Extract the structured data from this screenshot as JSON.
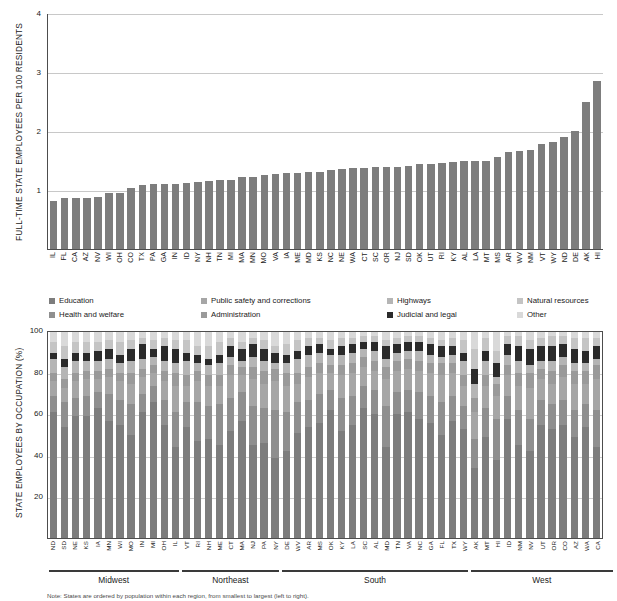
{
  "note": "Note: States are ordered by population within each region, from smallest to largest (left to right).",
  "legend": {
    "items": [
      {
        "label": "Education",
        "color": "#7d7d7d"
      },
      {
        "label": "Health and welfare",
        "color": "#8f8f8f"
      },
      {
        "label": "Public safety and corrections",
        "color": "#a6a6a6"
      },
      {
        "label": "Administration",
        "color": "#9a9a9a"
      },
      {
        "label": "Highways",
        "color": "#b5b5b5"
      },
      {
        "label": "Judicial and legal",
        "color": "#2b2b2b"
      },
      {
        "label": "Natural resources",
        "color": "#c4c4c4"
      },
      {
        "label": "Other",
        "color": "#d9d9d9"
      }
    ]
  },
  "regions": [
    {
      "name": "Midwest",
      "count": 12
    },
    {
      "name": "Northeast",
      "count": 9
    },
    {
      "name": "South",
      "count": 17
    },
    {
      "name": "West",
      "count": 13
    }
  ],
  "chart_data": [
    {
      "type": "bar",
      "id": "employees-per-100-residents",
      "title": "",
      "xlabel": "",
      "ylabel": "FULL-TIME STATE EMPLOYEES PER 100 RESIDENTS",
      "ylim": [
        0,
        4
      ],
      "yticks": [
        1,
        2,
        3,
        4
      ],
      "grid": true,
      "bar_color": "#7d7d7d",
      "categories": [
        "IL",
        "FL",
        "CA",
        "AZ",
        "NV",
        "WI",
        "OH",
        "CO",
        "TX",
        "PA",
        "GA",
        "IN",
        "ID",
        "NY",
        "NH",
        "TN",
        "MI",
        "MA",
        "MN",
        "MO",
        "VA",
        "IA",
        "ME",
        "MD",
        "KS",
        "NC",
        "NE",
        "WA",
        "CT",
        "SC",
        "OR",
        "NJ",
        "SD",
        "OK",
        "UT",
        "RI",
        "KY",
        "AL",
        "LA",
        "MT",
        "MS",
        "AR",
        "WV",
        "NM",
        "VT",
        "WY",
        "ND",
        "DE",
        "AK",
        "HI"
      ],
      "values": [
        0.82,
        0.86,
        0.87,
        0.87,
        0.88,
        0.95,
        0.96,
        1.04,
        1.09,
        1.1,
        1.1,
        1.11,
        1.13,
        1.14,
        1.16,
        1.18,
        1.18,
        1.22,
        1.22,
        1.26,
        1.28,
        1.3,
        1.3,
        1.31,
        1.31,
        1.35,
        1.37,
        1.38,
        1.38,
        1.39,
        1.39,
        1.4,
        1.41,
        1.44,
        1.44,
        1.46,
        1.48,
        1.49,
        1.49,
        1.49,
        1.56,
        1.65,
        1.66,
        1.69,
        1.78,
        1.83,
        1.9,
        2.01,
        2.51,
        2.86
      ]
    },
    {
      "type": "bar",
      "id": "employees-by-occupation",
      "stacked": true,
      "title": "",
      "xlabel": "",
      "ylabel": "STATE EMPLOYEES BY OCCUPATION (%)",
      "ylim": [
        0,
        100
      ],
      "yticks": [
        20,
        40,
        60,
        80,
        100
      ],
      "grid": true,
      "categories": [
        "ND",
        "SD",
        "NE",
        "KS",
        "IA",
        "MN",
        "WI",
        "MO",
        "IN",
        "MI",
        "OH",
        "IL",
        "VT",
        "RI",
        "NH",
        "ME",
        "CT",
        "MA",
        "NJ",
        "PA",
        "NY",
        "DE",
        "WV",
        "AR",
        "MS",
        "OK",
        "KY",
        "LA",
        "SC",
        "AL",
        "MD",
        "TN",
        "VA",
        "NC",
        "GA",
        "FL",
        "TX",
        "WY",
        "AK",
        "MT",
        "HI",
        "ID",
        "NM",
        "NV",
        "UT",
        "OR",
        "CO",
        "AZ",
        "WA",
        "CA"
      ],
      "series": [
        {
          "name": "Education",
          "color": "#7d7d7d",
          "values": [
            61,
            54,
            59,
            59,
            63,
            57,
            55,
            50,
            61,
            66,
            55,
            44,
            54,
            47,
            48,
            45,
            52,
            57,
            45,
            46,
            39,
            42,
            51,
            54,
            56,
            62,
            52,
            55,
            63,
            60,
            44,
            60,
            61,
            58,
            56,
            50,
            57,
            53,
            34,
            49,
            38,
            58,
            45,
            42,
            55,
            53,
            55,
            49,
            54,
            44
          ]
        },
        {
          "name": "Health and welfare",
          "color": "#8f8f8f",
          "values": [
            8,
            12,
            9,
            10,
            8,
            13,
            12,
            15,
            9,
            8,
            12,
            17,
            12,
            19,
            16,
            20,
            16,
            14,
            19,
            17,
            23,
            19,
            15,
            13,
            14,
            10,
            16,
            14,
            11,
            12,
            20,
            11,
            11,
            13,
            13,
            16,
            12,
            11,
            14,
            14,
            20,
            11,
            17,
            16,
            12,
            12,
            12,
            13,
            11,
            18
          ]
        },
        {
          "name": "Public safety and corrections",
          "color": "#a6a6a6",
          "values": [
            7,
            7,
            8,
            8,
            6,
            8,
            9,
            10,
            8,
            6,
            9,
            13,
            8,
            10,
            10,
            9,
            11,
            8,
            13,
            12,
            14,
            13,
            9,
            11,
            10,
            8,
            11,
            11,
            9,
            9,
            13,
            10,
            10,
            10,
            11,
            13,
            11,
            10,
            13,
            11,
            11,
            10,
            12,
            15,
            10,
            10,
            11,
            13,
            10,
            15
          ]
        },
        {
          "name": "Administration",
          "color": "#9a9a9a",
          "values": [
            4,
            4,
            4,
            4,
            4,
            4,
            4,
            5,
            4,
            4,
            5,
            6,
            5,
            5,
            5,
            5,
            5,
            4,
            6,
            6,
            6,
            6,
            5,
            5,
            5,
            4,
            5,
            5,
            5,
            5,
            6,
            5,
            5,
            5,
            5,
            6,
            5,
            5,
            7,
            5,
            6,
            5,
            6,
            7,
            5,
            6,
            6,
            6,
            6,
            7
          ]
        },
        {
          "name": "Highways",
          "color": "#b5b5b5",
          "values": [
            7,
            6,
            6,
            5,
            5,
            5,
            5,
            6,
            5,
            4,
            5,
            5,
            7,
            4,
            5,
            6,
            4,
            3,
            5,
            5,
            3,
            5,
            7,
            6,
            5,
            5,
            5,
            5,
            4,
            5,
            4,
            4,
            4,
            5,
            4,
            3,
            4,
            7,
            7,
            7,
            3,
            5,
            6,
            4,
            4,
            5,
            4,
            4,
            4,
            3
          ]
        },
        {
          "name": "Judicial and legal",
          "color": "#2b2b2b",
          "values": [
            3,
            4,
            4,
            4,
            5,
            5,
            4,
            6,
            7,
            4,
            7,
            7,
            4,
            4,
            3,
            4,
            5,
            6,
            6,
            6,
            5,
            4,
            4,
            4,
            4,
            3,
            4,
            4,
            3,
            4,
            6,
            4,
            4,
            4,
            5,
            5,
            4,
            4,
            7,
            5,
            7,
            5,
            7,
            8,
            7,
            7,
            6,
            7,
            6,
            6
          ]
        },
        {
          "name": "Natural resources",
          "color": "#c4c4c4",
          "values": [
            5,
            6,
            5,
            5,
            4,
            4,
            6,
            4,
            3,
            4,
            4,
            4,
            6,
            4,
            6,
            6,
            4,
            3,
            3,
            4,
            3,
            5,
            5,
            4,
            3,
            4,
            4,
            3,
            3,
            3,
            3,
            3,
            3,
            3,
            3,
            3,
            4,
            6,
            10,
            6,
            6,
            4,
            5,
            4,
            4,
            5,
            4,
            5,
            6,
            4
          ]
        },
        {
          "name": "Other",
          "color": "#d9d9d9",
          "values": [
            5,
            7,
            5,
            5,
            5,
            4,
            5,
            4,
            3,
            4,
            3,
            4,
            4,
            7,
            7,
            5,
            3,
            5,
            3,
            4,
            7,
            6,
            4,
            3,
            3,
            4,
            3,
            3,
            2,
            2,
            4,
            3,
            2,
            2,
            3,
            4,
            3,
            4,
            8,
            3,
            9,
            2,
            2,
            4,
            3,
            2,
            2,
            3,
            3,
            3
          ]
        }
      ]
    }
  ]
}
